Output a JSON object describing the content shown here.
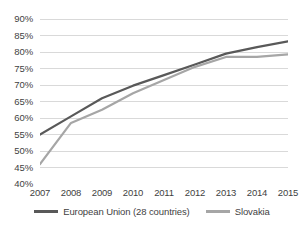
{
  "chart_data": {
    "type": "line",
    "title": "",
    "subtitle": "",
    "xlabel": "",
    "ylabel": "",
    "categories": [
      "2007",
      "2008",
      "2009",
      "2010",
      "2011",
      "2012",
      "2013",
      "2014",
      "2015"
    ],
    "x": [
      2007,
      2008,
      2009,
      2010,
      2011,
      2012,
      2013,
      2014,
      2015
    ],
    "ylim": [
      40,
      90
    ],
    "ytick_labels": [
      "90%",
      "85%",
      "80%",
      "75%",
      "70%",
      "65%",
      "60%",
      "55%",
      "50%",
      "45%",
      "40%"
    ],
    "ytick_values": [
      90,
      85,
      80,
      75,
      70,
      65,
      60,
      55,
      50,
      45,
      40
    ],
    "ytick_step": 5,
    "grid": true,
    "grid_axis": "y",
    "grid_color": "#d9d9d9",
    "legend_position": "bottom",
    "value_suffix": "%",
    "series": [
      {
        "name": "European Union (28 countries)",
        "color": "#595959",
        "values": [
          55.0,
          60.5,
          66.0,
          69.8,
          73.0,
          76.2,
          79.5,
          81.5,
          83.2
        ]
      },
      {
        "name": "Slovakia",
        "color": "#a6a6a6",
        "values": [
          46.0,
          58.5,
          62.5,
          67.5,
          71.5,
          75.5,
          78.5,
          78.5,
          79.3
        ]
      }
    ]
  },
  "legend": {
    "entries": [
      {
        "label": "European Union (28 countries)",
        "color": "#595959"
      },
      {
        "label": "Slovakia",
        "color": "#a6a6a6"
      }
    ]
  }
}
